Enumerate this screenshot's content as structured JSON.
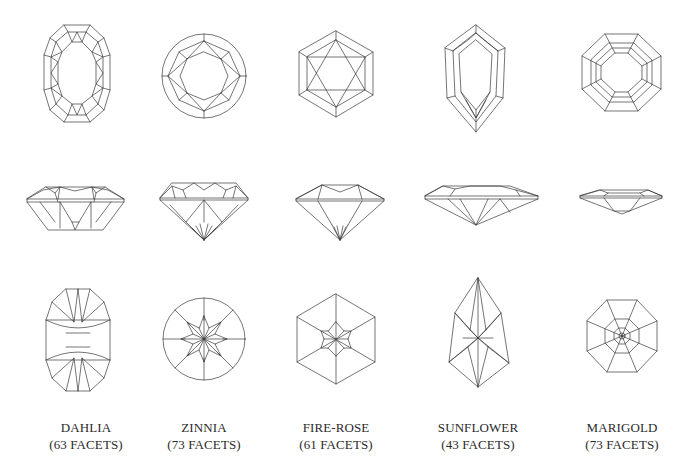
{
  "gems": [
    {
      "name": "DAHLIA",
      "facets": "(63 FACETS)",
      "center_x": 86
    },
    {
      "name": "ZINNIA",
      "facets": "(73 FACETS)",
      "center_x": 204
    },
    {
      "name": "FIRE-ROSE",
      "facets": "(61 FACETS)",
      "center_x": 336
    },
    {
      "name": "SUNFLOWER",
      "facets": "(43 FACETS)",
      "center_x": 478
    },
    {
      "name": "MARIGOLD",
      "facets": "(73 FACETS)",
      "center_x": 622
    }
  ],
  "views": [
    "crown-top-view",
    "side-profile-view",
    "pavilion-bottom-view"
  ],
  "line_color": "#3a3a3a",
  "background": "#ffffff"
}
